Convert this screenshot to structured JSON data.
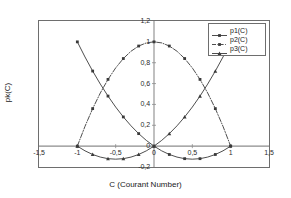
{
  "chart_data": {
    "type": "line",
    "title": "",
    "xlabel": "C (Courant Number)",
    "ylabel": "pk(C)",
    "xlim": [
      -1.5,
      1.5
    ],
    "ylim": [
      -0.2,
      1.2
    ],
    "grid": false,
    "legend_position": "top-right",
    "xticks": [
      "-1,5",
      "-1",
      "-0,5",
      "0",
      "0,5",
      "1",
      "1,5"
    ],
    "xtick_values": [
      -1.5,
      -1,
      -0.5,
      0,
      0.5,
      1,
      1.5
    ],
    "yticks": [
      "-0,2",
      "0",
      "0,2",
      "0,4",
      "0,6",
      "0,8",
      "1",
      "1,2"
    ],
    "ytick_values": [
      -0.2,
      0,
      0.2,
      0.4,
      0.6,
      0.8,
      1,
      1.2
    ],
    "series": [
      {
        "name": "p1(C)",
        "style": "solid",
        "marker": "square",
        "x": [
          -1,
          -0.9,
          -0.8,
          -0.7,
          -0.6,
          -0.5,
          -0.4,
          -0.3,
          -0.2,
          -0.1,
          0,
          0.1,
          0.2,
          0.3,
          0.4,
          0.5,
          0.6,
          0.7,
          0.8,
          0.9,
          1
        ],
        "values": [
          1,
          0.855,
          0.72,
          0.595,
          0.48,
          0.375,
          0.28,
          0.195,
          0.12,
          0.055,
          0,
          -0.045,
          -0.08,
          -0.105,
          -0.12,
          -0.125,
          -0.12,
          -0.105,
          -0.08,
          -0.045,
          0
        ]
      },
      {
        "name": "p2(C)",
        "style": "dash-dot",
        "marker": "square",
        "x": [
          -1,
          -0.9,
          -0.8,
          -0.7,
          -0.6,
          -0.5,
          -0.4,
          -0.3,
          -0.2,
          -0.1,
          0,
          0.1,
          0.2,
          0.3,
          0.4,
          0.5,
          0.6,
          0.7,
          0.8,
          0.9,
          1
        ],
        "values": [
          0,
          0.19,
          0.36,
          0.51,
          0.64,
          0.75,
          0.84,
          0.91,
          0.96,
          0.99,
          1,
          0.99,
          0.96,
          0.91,
          0.84,
          0.75,
          0.64,
          0.51,
          0.36,
          0.19,
          0
        ]
      },
      {
        "name": "p3(C)",
        "style": "solid",
        "marker": "triangle",
        "x": [
          -1,
          -0.9,
          -0.8,
          -0.7,
          -0.6,
          -0.5,
          -0.4,
          -0.3,
          -0.2,
          -0.1,
          0,
          0.1,
          0.2,
          0.3,
          0.4,
          0.5,
          0.6,
          0.7,
          0.8,
          0.9,
          1
        ],
        "values": [
          0,
          -0.045,
          -0.08,
          -0.105,
          -0.12,
          -0.125,
          -0.12,
          -0.105,
          -0.08,
          -0.045,
          0,
          0.055,
          0.12,
          0.195,
          0.28,
          0.375,
          0.48,
          0.595,
          0.72,
          0.855,
          1
        ]
      }
    ],
    "colors": {
      "axis": "#6e6e6e",
      "zero_axis": "#8c8c8c",
      "curve": "#3a3a3a",
      "text": "#1a1a1a",
      "background": "#ffffff"
    }
  },
  "legend": {
    "items": [
      {
        "label": "p1(C)"
      },
      {
        "label": "p2(C)"
      },
      {
        "label": "p3(C)"
      }
    ]
  }
}
